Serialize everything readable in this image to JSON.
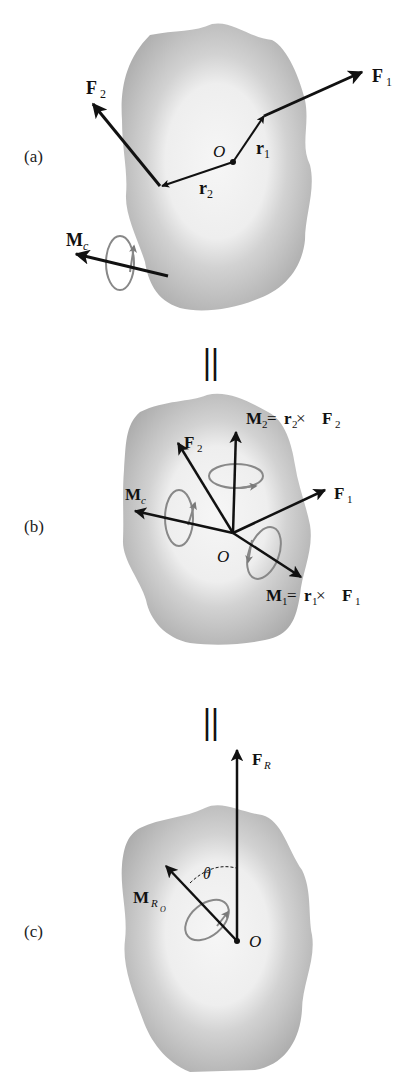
{
  "figure": {
    "panels": [
      {
        "id": "a",
        "label": "(a)",
        "vectors": [
          {
            "name": "F",
            "sub": "1"
          },
          {
            "name": "F",
            "sub": "2"
          },
          {
            "name": "r",
            "sub": "1"
          },
          {
            "name": "r",
            "sub": "2"
          },
          {
            "name": "M",
            "sub": "c"
          }
        ],
        "origin_label": "O"
      },
      {
        "id": "b",
        "label": "(b)",
        "vectors": [
          {
            "name": "M",
            "sub": "2",
            "eq": " = ",
            "r": "r",
            "rsub": "2",
            "times": " × ",
            "f": "F",
            "fsub": "2"
          },
          {
            "name": "F",
            "sub": "2"
          },
          {
            "name": "F",
            "sub": "1"
          },
          {
            "name": "M",
            "sub": "c"
          },
          {
            "name": "M",
            "sub": "1",
            "eq": " = ",
            "r": "r",
            "rsub": "1",
            "times": " × ",
            "f": "F",
            "fsub": "1"
          }
        ],
        "origin_label": "O"
      },
      {
        "id": "c",
        "label": "(c)",
        "vectors": [
          {
            "name": "F",
            "sub": "R"
          },
          {
            "name": "M",
            "sub": "R",
            "subsub": "O"
          }
        ],
        "angle_label": "θ",
        "origin_label": "O"
      }
    ],
    "equals_sign": "||",
    "colors": {
      "vector": "#111111",
      "moment_ring": "#808080",
      "body_outer": "#b8b8b8",
      "body_inner": "#f2f2f2"
    }
  }
}
